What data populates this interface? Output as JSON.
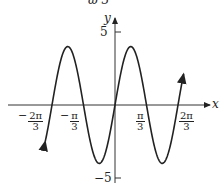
{
  "header": {
    "partial_text": "ω   3"
  },
  "axes": {
    "x_label": "x",
    "y_label": "y"
  },
  "y_ticks": [
    {
      "label": "5",
      "value": 5
    },
    {
      "label": "−5",
      "value": -5
    }
  ],
  "x_ticks": [
    {
      "sign": "−",
      "num": "2π",
      "den": "3",
      "value": -2.0944
    },
    {
      "sign": "−",
      "num": "π",
      "den": "3",
      "value": -1.0472
    },
    {
      "sign": "",
      "num": "π",
      "den": "3",
      "value": 1.0472
    },
    {
      "sign": "",
      "num": "2π",
      "den": "3",
      "value": 2.0944
    }
  ],
  "chart_data": {
    "type": "line",
    "title": "",
    "function": "y = 4 sin(3x)",
    "xlabel": "x",
    "ylabel": "y",
    "xlim": [
      -2.1,
      2.4
    ],
    "ylim": [
      -5,
      5
    ],
    "x_tick_labels": [
      "−2π/3",
      "−π/3",
      "π/3",
      "2π/3"
    ],
    "y_tick_labels": [
      "5",
      "−5"
    ],
    "series": [
      {
        "name": "y = 4 sin 3x",
        "amplitude": 4,
        "period": "2π/3",
        "x": [
          -2.0944,
          -1.5708,
          -1.0472,
          -0.5236,
          0,
          0.5236,
          1.0472,
          1.5708,
          2.0944
        ],
        "values": [
          0,
          4,
          0,
          -4,
          0,
          4,
          0,
          -4,
          0
        ]
      }
    ],
    "grid": false,
    "legend": "none"
  }
}
